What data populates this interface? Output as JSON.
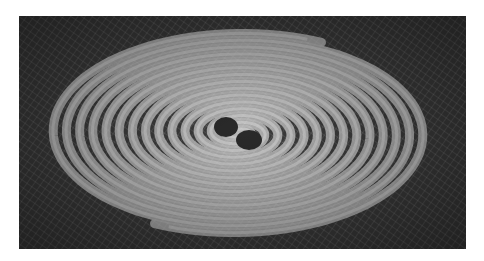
{
  "image": {
    "subject": "gravitational-wave spiral from binary black hole merger",
    "description": "Two black holes at center of a spiral of ripples on a wireframe spacetime mesh",
    "colors": {
      "background": "#ffffff",
      "groove": "#3c3c3c",
      "ridge": "#b8b8b8",
      "mesh": "#e8e8e8",
      "black_hole": "#2a2a2a"
    },
    "black_holes": [
      {
        "cx": 207,
        "cy": 111,
        "rx": 12,
        "ry": 10
      },
      {
        "cx": 230,
        "cy": 124,
        "rx": 13,
        "ry": 10
      }
    ]
  }
}
